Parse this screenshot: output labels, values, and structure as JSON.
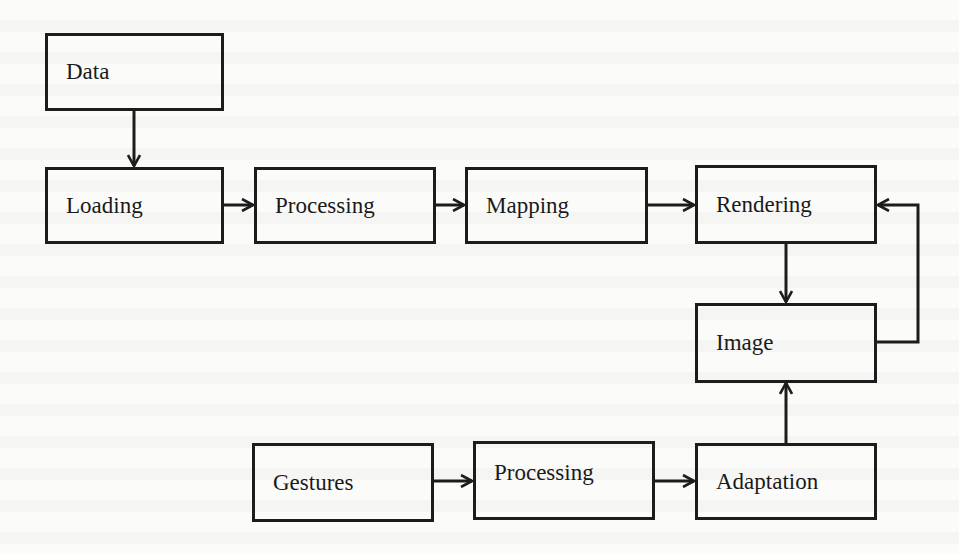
{
  "diagram": {
    "type": "flowchart",
    "nodes": {
      "data": {
        "label": "Data"
      },
      "loading": {
        "label": "Loading"
      },
      "processing": {
        "label": "Processing"
      },
      "mapping": {
        "label": "Mapping"
      },
      "rendering": {
        "label": "Rendering"
      },
      "image": {
        "label": "Image"
      },
      "gestures": {
        "label": "Gestures"
      },
      "gesture_processing": {
        "label": "Processing"
      },
      "adaptation": {
        "label": "Adaptation"
      }
    },
    "edges": [
      {
        "from": "Data",
        "to": "Loading"
      },
      {
        "from": "Loading",
        "to": "Processing"
      },
      {
        "from": "Processing",
        "to": "Mapping"
      },
      {
        "from": "Mapping",
        "to": "Rendering"
      },
      {
        "from": "Rendering",
        "to": "Image"
      },
      {
        "from": "Image",
        "to": "Rendering",
        "note": "feedback loop"
      },
      {
        "from": "Gestures",
        "to": "Processing"
      },
      {
        "from": "Processing",
        "to": "Adaptation"
      },
      {
        "from": "Adaptation",
        "to": "Image"
      }
    ],
    "colors": {
      "stroke": "#1c1c1c",
      "text": "#1a1a1a",
      "background": "#fbfbfa"
    }
  }
}
